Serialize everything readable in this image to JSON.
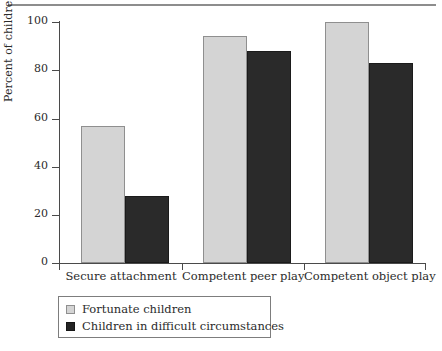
{
  "chart_data": {
    "type": "bar",
    "title": "",
    "xlabel": "",
    "ylabel": "Percent of children",
    "ylim": [
      0,
      100
    ],
    "yticks": [
      0,
      20,
      40,
      60,
      80,
      100
    ],
    "grid": false,
    "legend_position": "bottom-left",
    "categories": [
      "Secure attachment",
      "Competent peer play",
      "Competent object play"
    ],
    "series": [
      {
        "name": "Fortunate children",
        "color": "#d4d4d4",
        "values": [
          57,
          94,
          100
        ]
      },
      {
        "name": "Children in difficult circumstances",
        "color": "#2a2a2a",
        "values": [
          28,
          88,
          83
        ]
      }
    ]
  },
  "axis": {
    "y_tick_labels": [
      "0",
      "20",
      "40",
      "60",
      "80",
      "100"
    ],
    "y_title": "Percent of children"
  },
  "legend": {
    "entries": [
      {
        "label": "Fortunate children",
        "swatch": "light-gray-swatch"
      },
      {
        "label": "Children in difficult circumstances",
        "swatch": "dark-swatch"
      }
    ]
  },
  "colors": {
    "series_light": "#d4d4d4",
    "series_dark": "#2a2a2a",
    "axis": "#4a4a4a",
    "rule": "#8d8d8d",
    "text": "#2b2b2b"
  }
}
